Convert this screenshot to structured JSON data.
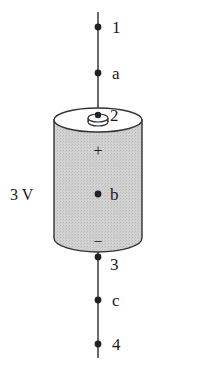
{
  "diagram": {
    "type": "battery-circuit",
    "battery": {
      "voltage_label": "3 V",
      "positive_symbol": "+",
      "negative_symbol": "−",
      "fill_color": "#cfcfcf",
      "stroke_color": "#333333"
    },
    "points": [
      {
        "id": "1",
        "label": "1",
        "x": 98,
        "y": 27
      },
      {
        "id": "a",
        "label": "a",
        "x": 98,
        "y": 73
      },
      {
        "id": "2",
        "label": "2",
        "x": 98,
        "y": 116
      },
      {
        "id": "b",
        "label": "b",
        "x": 98,
        "y": 194
      },
      {
        "id": "3",
        "label": "3",
        "x": 98,
        "y": 257
      },
      {
        "id": "c",
        "label": "c",
        "x": 98,
        "y": 300
      },
      {
        "id": "4",
        "label": "4",
        "x": 98,
        "y": 344
      }
    ],
    "wire_color": "#444444",
    "dot_color": "#222222"
  }
}
